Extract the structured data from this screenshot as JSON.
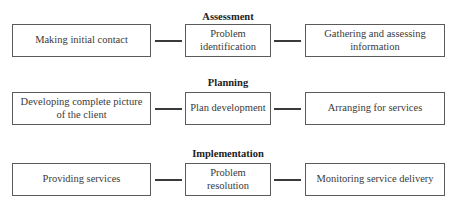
{
  "diagram": {
    "sections": [
      {
        "title": "Assessment",
        "steps": [
          "Making initial contact",
          "Problem identification",
          "Gathering and assessing information"
        ]
      },
      {
        "title": "Planning",
        "steps": [
          "Developing complete picture of the client",
          "Plan development",
          "Arranging for services"
        ]
      },
      {
        "title": "Implementation",
        "steps": [
          "Providing services",
          "Problem resolution",
          "Monitoring service delivery"
        ]
      }
    ]
  }
}
